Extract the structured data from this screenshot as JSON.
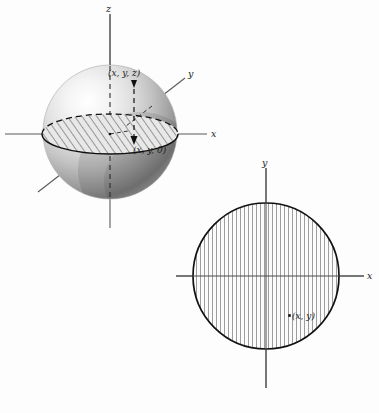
{
  "figure": {
    "caption_absent": true,
    "background_color": "#fdfdfd",
    "ink_color": "#1a1a1a",
    "panels": [
      {
        "id": "sphere-panel",
        "name": "3d-sphere-with-equatorial-disk",
        "axes": [
          {
            "name": "z-axis",
            "label": "z",
            "orientation": "vertical"
          },
          {
            "name": "x-axis",
            "label": "x",
            "orientation": "horizontal"
          },
          {
            "name": "y-axis",
            "label": "y",
            "orientation": "diagonal"
          }
        ],
        "point_labels": [
          {
            "name": "point-xyz",
            "label": "(x, y, z)"
          },
          {
            "name": "point-xy0",
            "label": "(x, y, 0)"
          }
        ],
        "shading": {
          "highlight": "#fafafa",
          "midtone": "#c9c9c9",
          "shadow": "#8a8a8a",
          "deep_shadow": "#6e6e6e"
        },
        "disk_hatch": {
          "style": "diagonal",
          "angle_deg": 35,
          "spacing_px": 6
        }
      },
      {
        "id": "disk-panel",
        "name": "2d-circle-projection",
        "axes": [
          {
            "name": "y-axis",
            "label": "y",
            "orientation": "vertical"
          },
          {
            "name": "x-axis",
            "label": "x",
            "orientation": "horizontal"
          }
        ],
        "point_labels": [
          {
            "name": "point-xy",
            "label": "(x, y)"
          }
        ],
        "disk_hatch": {
          "style": "vertical",
          "angle_deg": 90,
          "spacing_px": 4
        }
      }
    ]
  },
  "labels": {
    "sphere_z": "z",
    "sphere_x": "x",
    "sphere_y": "y",
    "sphere_point_top": "(x, y, z)",
    "sphere_point_base": "(x, y, 0)",
    "disk_y": "y",
    "disk_x": "x",
    "disk_point": "(x, y)"
  },
  "geometry": {
    "sphere": {
      "cx": 110,
      "cy": 132,
      "r": 67
    },
    "equator_ellipse": {
      "cx": 110,
      "cy": 134,
      "rx": 68,
      "ry": 20
    },
    "circle": {
      "cx": 266,
      "cy": 276,
      "r": 73
    }
  }
}
